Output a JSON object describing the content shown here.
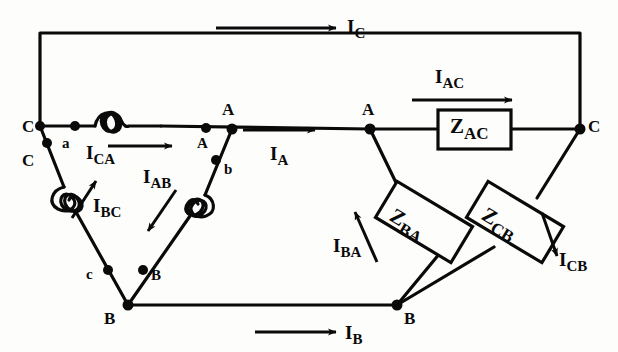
{
  "diagram": {
    "stroke_color": "#0a0a0a",
    "background_color": "#fdfdfc",
    "line_nodes": [
      {
        "name": "line-node-C-left",
        "label": "C",
        "x": 22,
        "y": 118
      },
      {
        "name": "line-node-A-mid",
        "label": "A",
        "x": 222,
        "y": 101
      },
      {
        "name": "line-node-A-right",
        "label": "A",
        "x": 362,
        "y": 101
      },
      {
        "name": "line-node-C-right",
        "label": "C",
        "x": 588,
        "y": 118
      },
      {
        "name": "line-node-B-left",
        "label": "B",
        "x": 104,
        "y": 310
      },
      {
        "name": "line-node-B-right",
        "label": "B",
        "x": 404,
        "y": 310
      }
    ],
    "winding_terminals": [
      {
        "name": "terminal-a",
        "label": "a",
        "x": 62,
        "y": 136
      },
      {
        "name": "terminal-A-delta",
        "label": "A",
        "x": 197,
        "y": 136
      },
      {
        "name": "terminal-b",
        "label": "b",
        "x": 224,
        "y": 162
      },
      {
        "name": "terminal-C-delta",
        "label": "C",
        "x": 22,
        "y": 152
      },
      {
        "name": "terminal-c",
        "label": "c",
        "x": 86,
        "y": 267
      },
      {
        "name": "terminal-B-delta",
        "label": "B",
        "x": 151,
        "y": 268
      }
    ],
    "line_currents": [
      {
        "name": "current-IC",
        "base": "I",
        "sub": "C",
        "label_x": 347,
        "label_y": 17,
        "arrow": {
          "x1": 216,
          "y1": 28,
          "x2": 336,
          "y2": 28
        }
      },
      {
        "name": "current-IA",
        "base": "I",
        "sub": "A",
        "label_x": 270,
        "label_y": 144,
        "arrow": {
          "x1": 243,
          "y1": 130,
          "x2": 315,
          "y2": 130
        }
      },
      {
        "name": "current-IAC",
        "base": "I",
        "sub": "AC",
        "label_x": 435,
        "label_y": 67,
        "arrow": {
          "x1": 412,
          "y1": 100,
          "x2": 512,
          "y2": 100
        }
      },
      {
        "name": "current-IB",
        "base": "I",
        "sub": "B",
        "label_x": 345,
        "label_y": 323,
        "arrow": {
          "x1": 255,
          "y1": 332,
          "x2": 336,
          "y2": 332
        }
      }
    ],
    "winding_currents": [
      {
        "name": "current-ICA",
        "base": "I",
        "sub": "CA",
        "label_x": 86,
        "label_y": 143,
        "arrow": {
          "x1": 108,
          "y1": 146,
          "x2": 172,
          "y2": 146
        }
      },
      {
        "name": "current-IBC",
        "base": "I",
        "sub": "BC",
        "label_x": 93,
        "label_y": 196,
        "arrow": {
          "x1": 72,
          "y1": 218,
          "x2": 96,
          "y2": 181
        }
      },
      {
        "name": "current-IAB",
        "base": "I",
        "sub": "AB",
        "label_x": 143,
        "label_y": 167,
        "arrow": {
          "x1": 176,
          "y1": 190,
          "x2": 148,
          "y2": 231
        }
      },
      {
        "name": "current-IBA",
        "base": "I",
        "sub": "BA",
        "label_x": 333,
        "label_y": 236,
        "arrow": {
          "x1": 377,
          "y1": 262,
          "x2": 355,
          "y2": 212
        }
      },
      {
        "name": "current-ICB",
        "base": "I",
        "sub": "CB",
        "label_x": 559,
        "label_y": 250,
        "arrow": {
          "x1": 542,
          "y1": 213,
          "x2": 557,
          "y2": 256
        }
      }
    ],
    "impedance_boxes": [
      {
        "name": "impedance-ZAC",
        "base": "Z",
        "sub": "AC",
        "cx": 474,
        "cy": 129,
        "w": 74,
        "h": 39,
        "rot": 0,
        "label_x": 450,
        "label_y": 116
      },
      {
        "name": "impedance-ZBA",
        "base": "Z",
        "sub": "BA",
        "cx": 424,
        "cy": 222,
        "w": 88,
        "h": 42,
        "rot": 31,
        "label_x": 397,
        "label_y": 205
      },
      {
        "name": "impedance-ZCB",
        "base": "Z",
        "sub": "CB",
        "cx": 515,
        "cy": 222,
        "w": 88,
        "h": 42,
        "rot": 31,
        "label_x": 489,
        "label_y": 204
      }
    ],
    "wire_segments": [
      {
        "name": "wire-top-C-line"
      },
      {
        "name": "wire-middle-A-line"
      },
      {
        "name": "wire-bottom-B-line"
      },
      {
        "name": "wire-delta-CA-winding"
      },
      {
        "name": "wire-delta-BC-winding"
      },
      {
        "name": "wire-delta-AB-winding"
      },
      {
        "name": "wire-wye-A-branch"
      },
      {
        "name": "wire-wye-C-branch"
      }
    ]
  }
}
